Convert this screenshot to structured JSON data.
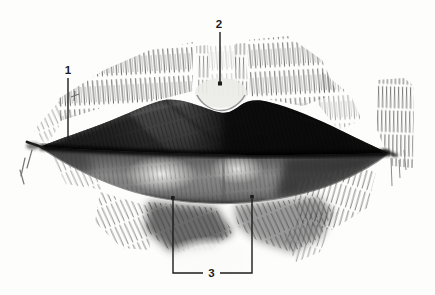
{
  "figure": {
    "kind": "pencil-sketch-of-lips-with-numbered-callouts",
    "callouts": [
      {
        "label": "1"
      },
      {
        "label": "2"
      },
      {
        "label": "3"
      }
    ],
    "colors": {
      "paper": "#fdfdfc",
      "ink": "#1c1c1c",
      "graphite_dark": "#101010",
      "graphite_mid": "#777777",
      "highlight": "#f2f2f0"
    }
  }
}
